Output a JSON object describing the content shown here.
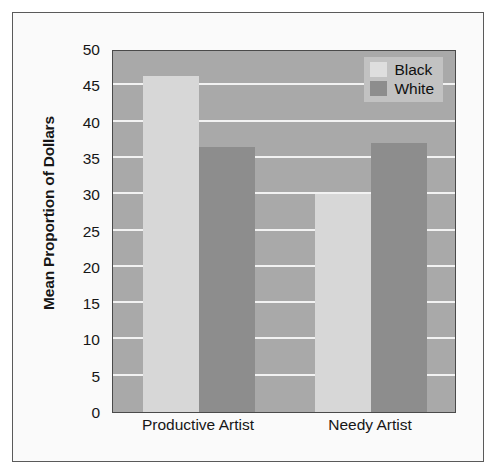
{
  "chart_data": {
    "type": "bar",
    "title": "",
    "xlabel": "",
    "ylabel": "Mean Proportion of Dollars",
    "categories": [
      "Productive Artist",
      "Needy Artist"
    ],
    "series": [
      {
        "name": "Black",
        "values": [
          46.3,
          30.0
        ],
        "color": "#d7d7d7"
      },
      {
        "name": "White",
        "values": [
          36.5,
          37.0
        ],
        "color": "#8d8d8d"
      }
    ],
    "ylim": [
      0,
      50
    ],
    "yticks": [
      0,
      5,
      10,
      15,
      20,
      25,
      30,
      35,
      40,
      45,
      50
    ],
    "ytick_labels": [
      "0",
      "5",
      "10",
      "15",
      "20",
      "25",
      "30",
      "35",
      "40",
      "45",
      "50"
    ],
    "grid": true,
    "grid_axis": "y",
    "grid_color": "#f2f2f2",
    "legend_position": "top-right",
    "legend_entries": [
      "Black",
      "White"
    ],
    "plot_background": "#a9a9a9",
    "figure_background": "#fafafa",
    "frame_color": "#5a5a5a"
  }
}
